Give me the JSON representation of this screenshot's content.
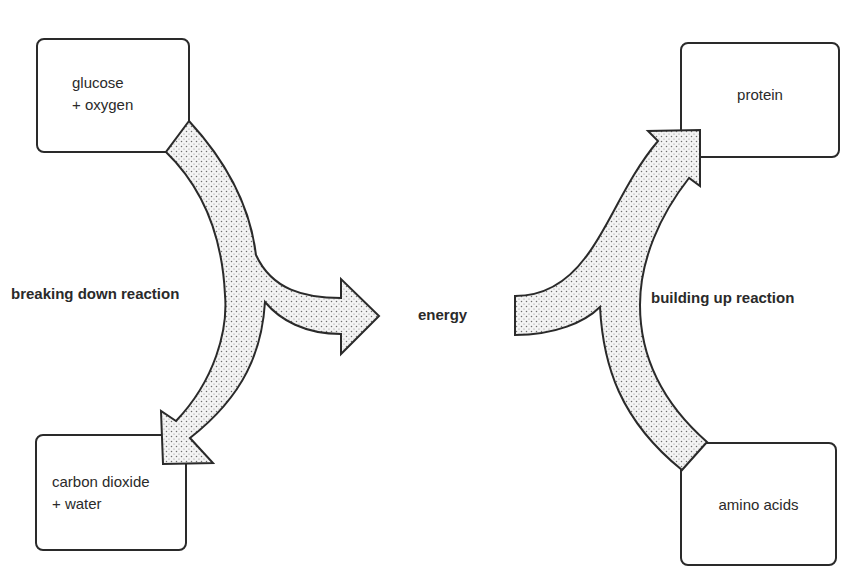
{
  "diagram": {
    "boxes": {
      "glucose_oxygen": {
        "line1": "glucose",
        "line2": "+ oxygen"
      },
      "carbon_dioxide_water": {
        "line1": "carbon dioxide",
        "line2": "+ water"
      },
      "protein": {
        "label": "protein"
      },
      "amino_acids": {
        "label": "amino acids"
      }
    },
    "labels": {
      "breaking_down": "breaking down reaction",
      "energy": "energy",
      "building_up": "building up reaction"
    },
    "colors": {
      "stroke": "#2a2a2a",
      "arrow_fill": "#f2f2f2",
      "stipple": "#7a7a7a",
      "background": "#ffffff"
    }
  }
}
